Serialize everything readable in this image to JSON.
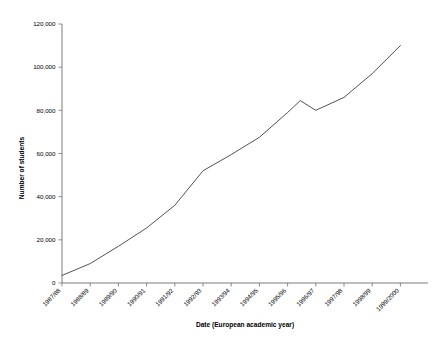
{
  "chart_data": {
    "type": "line",
    "title": "",
    "subtitle": "",
    "xlabel": "Date (European academic year)",
    "ylabel": "Number of students",
    "categories": [
      "1987/88",
      "1988/89",
      "1989/90",
      "1990/91",
      "1991/92",
      "1992/93",
      "1993/94",
      "1994/95",
      "1995/96",
      "1996/97",
      "1997/98",
      "1998/99",
      "1999/2000"
    ],
    "values": [
      3500,
      9000,
      17000,
      25500,
      36000,
      52000,
      59500,
      67500,
      79000,
      80000,
      86000,
      97000,
      110000
    ],
    "series": [
      {
        "name": "Number of students",
        "values": [
          3500,
          9000,
          17000,
          25500,
          36000,
          52000,
          59500,
          67500,
          79000,
          80000,
          86000,
          97000,
          110000
        ]
      }
    ],
    "peak": {
      "label": "1995/96",
      "value": 84500
    },
    "dip": {
      "label": "1996/97",
      "value": 79800
    },
    "ylim": [
      0,
      120000
    ],
    "ytick_values": [
      0,
      20000,
      40000,
      60000,
      80000,
      100000,
      120000
    ],
    "ytick_labels": [
      "0",
      "20,000",
      "40,000",
      "60,000",
      "80,000",
      "100,000",
      "120,000"
    ],
    "grid": false,
    "legend": false,
    "legend_position": "none",
    "line_color": "#4a4a4a",
    "axis_color": "#6e6e6e",
    "background_color": "#ffffff",
    "xtick_label_rotation": -45
  }
}
